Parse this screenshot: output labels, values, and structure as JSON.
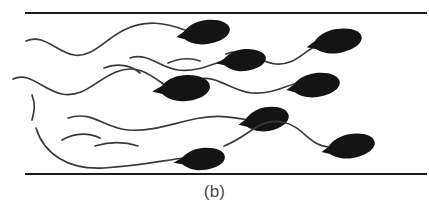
{
  "figure": {
    "caption": "(b)",
    "background_color": "#ffffff",
    "width": 429,
    "height": 208,
    "walls": {
      "name": "channel-walls",
      "color": "#1a1a1a",
      "stroke_width": 2,
      "count": 2,
      "lines": [
        {
          "label": "top-wall",
          "x1": 25,
          "y1": 13,
          "x2": 427,
          "y2": 13
        },
        {
          "label": "bottom-wall",
          "x1": 25,
          "y1": 174,
          "x2": 427,
          "y2": 174
        }
      ]
    },
    "cells": {
      "name": "sperm-cells",
      "count": 8,
      "head_color": "#141414",
      "tail_color": "#3a3a3a",
      "tail_stroke_width": 1.7,
      "items": [
        {
          "id": "cell-1",
          "head": {
            "cx": 207,
            "cy": 32,
            "rx": 23,
            "ry": 12,
            "rotation": -8
          },
          "tail": "M 26,41 C 44,33 56,52 74,55 C 92,58 104,40 124,30 C 146,19 166,23 185,30"
        },
        {
          "id": "cell-2",
          "head": {
            "cx": 338,
            "cy": 41,
            "rx": 24,
            "ry": 12,
            "rotation": -10
          },
          "tail": "M 226,54 C 246,46 258,63 276,64 C 296,65 302,52 318,45"
        },
        {
          "id": "cell-3",
          "head": {
            "cx": 245,
            "cy": 60,
            "rx": 21,
            "ry": 11,
            "rotation": -6
          },
          "tail": "M 130,58 C 148,52 160,68 178,70 C 198,72 212,64 226,60"
        },
        {
          "id": "cell-4",
          "head": {
            "cx": 317,
            "cy": 85,
            "rx": 23,
            "ry": 12,
            "rotation": -8
          },
          "tail": "M 196,80 C 216,73 232,92 252,93 C 274,94 284,86 298,83"
        },
        {
          "id": "cell-5",
          "head": {
            "cx": 186,
            "cy": 88,
            "rx": 24,
            "ry": 13,
            "rotation": -5
          },
          "tail": "M 13,79 C 30,71 42,90 62,94 C 84,98 96,80 116,72 C 138,63 152,76 166,86"
        },
        {
          "id": "cell-6",
          "head": {
            "cx": 268,
            "cy": 119,
            "rx": 21,
            "ry": 12,
            "rotation": -10
          },
          "tail": "M 68,118 C 92,110 104,128 128,130 C 154,132 176,122 200,118 C 224,114 238,119 250,120"
        },
        {
          "id": "cell-7",
          "head": {
            "cx": 352,
            "cy": 146,
            "rx": 23,
            "ry": 12,
            "rotation": -10
          },
          "tail": "M 224,146 C 250,136 258,118 282,122 C 304,126 308,146 330,147"
        },
        {
          "id": "cell-8",
          "head": {
            "cx": 203,
            "cy": 159,
            "rx": 22,
            "ry": 11,
            "rotation": -6
          },
          "tail": "M 36,128 C 44,154 68,170 104,168 C 140,166 166,160 184,158"
        }
      ]
    },
    "loose_tails": {
      "name": "free-flagella-strands",
      "count": 5,
      "color": "#3a3a3a",
      "paths": [
        "M 104,68 C 118,62 132,66 140,73",
        "M 32,95 C 36,105 34,112 32,120",
        "M 62,140 C 76,132 90,133 100,138",
        "M 95,146 C 112,141 126,142 138,146",
        "M 168,63 C 180,58 192,58 200,61"
      ]
    }
  }
}
